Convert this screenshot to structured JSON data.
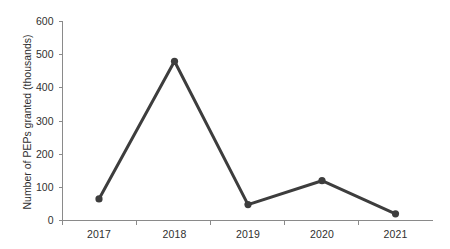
{
  "chart_data": {
    "type": "line",
    "title": "",
    "xlabel": "",
    "ylabel": "Number of PEPs granted (thousands)",
    "categories": [
      "2017",
      "2018",
      "2019",
      "2020",
      "2021"
    ],
    "values": [
      65,
      480,
      48,
      120,
      20
    ],
    "series": [
      {
        "name": "PEPs granted",
        "values": [
          65,
          480,
          48,
          120,
          20
        ]
      }
    ],
    "ylim": [
      0,
      600
    ],
    "ytick_labels": [
      "0",
      "100",
      "200",
      "300",
      "400",
      "500",
      "600"
    ],
    "ytick_values": [
      0,
      100,
      200,
      300,
      400,
      500,
      600
    ],
    "xtick_labels": [
      "2017",
      "2018",
      "2019",
      "2020",
      "2021"
    ],
    "grid": false,
    "legend": false,
    "legend_position": "none",
    "marker": "circle",
    "colors": {
      "line": "#3d3d3d",
      "marker": "#3d3d3d",
      "axis": "#8a8a8a",
      "text": "#2f2f2f",
      "background": "#ffffff"
    }
  }
}
